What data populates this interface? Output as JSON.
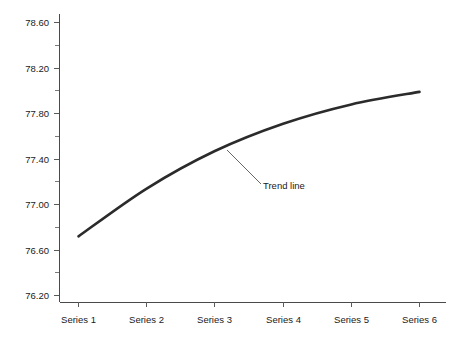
{
  "chart_data": {
    "type": "line",
    "title": "",
    "subtitle": "",
    "xlabel": "",
    "ylabel": "",
    "categories": [
      "Series 1",
      "Series 2",
      "Series 3",
      "Series 4",
      "Series 5",
      "Series 6"
    ],
    "series": [
      {
        "name": "Trend line",
        "values": [
          76.72,
          77.14,
          77.47,
          77.71,
          77.88,
          77.99
        ],
        "color": "#2b2b2b"
      }
    ],
    "ylim": [
      76.0,
      78.6
    ],
    "y_ticks": [
      "78.60",
      "78.20",
      "77.80",
      "77.40",
      "77.00",
      "76.60",
      "76.20"
    ],
    "y_tick_values": [
      78.6,
      78.2,
      77.8,
      77.4,
      77.0,
      76.6,
      76.2
    ],
    "y_minor_ticks_between": 1,
    "x_ticks": [
      "Series 1",
      "Series 2",
      "Series 3",
      "Series 4",
      "Series 5",
      "Series 6"
    ],
    "grid": false,
    "legend": false,
    "legend_position": "none",
    "annotations": [
      {
        "text": "Trend line",
        "target_point_index": 3,
        "target_value": 77.55
      }
    ],
    "axis_color": "#4a4a4a",
    "background_color": "#ffffff",
    "smooth": true
  }
}
